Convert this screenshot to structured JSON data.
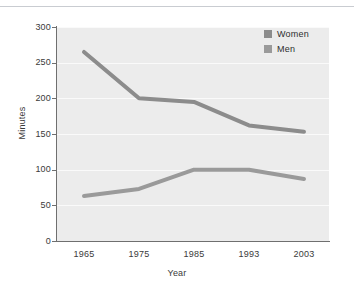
{
  "chart_data": {
    "type": "line",
    "title": "",
    "xlabel": "Year",
    "ylabel": "Minutes",
    "categories": [
      "1965",
      "1975",
      "1985",
      "1993",
      "2003"
    ],
    "series": [
      {
        "name": "Women",
        "color": "#8c8c8c",
        "values": [
          265,
          200,
          195,
          162,
          153
        ]
      },
      {
        "name": "Men",
        "color": "#9a9a9a",
        "values": [
          63,
          73,
          100,
          100,
          87
        ]
      }
    ],
    "ylim": [
      0,
      300
    ],
    "yticks": [
      0,
      50,
      100,
      150,
      200,
      250,
      300
    ],
    "ytick_labels": [
      "0",
      "50",
      "100",
      "150",
      "200",
      "250",
      "300"
    ],
    "grid": "horizontal",
    "gridline_color": "#fafafa",
    "plot_background": "#ececec",
    "axis_color": "#6f6f6f",
    "legend_position": "top-right",
    "legend_entries": [
      "Women",
      "Men"
    ]
  },
  "axes": {
    "x_title": "Year",
    "y_title": "Minutes"
  },
  "legend": {
    "items": [
      {
        "label": "Women"
      },
      {
        "label": "Men"
      }
    ]
  }
}
